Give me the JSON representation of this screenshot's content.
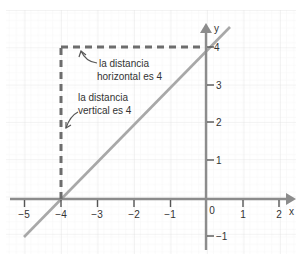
{
  "diagram": {
    "type": "coordinate-plane",
    "axes": {
      "x_label": "x",
      "y_label": "y",
      "x_ticks": [
        "−5",
        "−4",
        "−3",
        "−2",
        "−1",
        "0",
        "1",
        "2"
      ],
      "y_ticks": [
        "4",
        "3",
        "2",
        "1",
        "−1"
      ],
      "x_tick_values": [
        -5,
        -4,
        -3,
        -2,
        -1,
        1,
        2
      ],
      "y_tick_values": [
        4,
        3,
        2,
        1,
        -1
      ],
      "origin_label": "0"
    },
    "line": {
      "description": "y = x + 4",
      "from": [
        -5,
        -1
      ],
      "to": [
        0.7,
        4.7
      ],
      "color": "#a6a6a6"
    },
    "dashed_segments": {
      "vertical": {
        "from": [
          -4,
          0
        ],
        "to": [
          -4,
          4
        ]
      },
      "horizontal": {
        "from": [
          -4,
          4
        ],
        "to": [
          0,
          4
        ]
      },
      "color": "#6d6d6d"
    },
    "annotations": {
      "horizontal": {
        "line1": "la distancia",
        "line2": "horizontal es 4"
      },
      "vertical": {
        "line1": "la distancia",
        "line2": "vertical es 4"
      }
    },
    "colors": {
      "axis": "#8c8c8c",
      "grid_minor": "#efefef",
      "grid_major": "#e2e2e2",
      "text": "#333333"
    }
  }
}
